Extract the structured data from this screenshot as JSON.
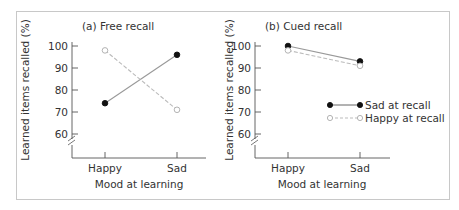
{
  "figure": {
    "border_color": "#c8c8c8",
    "axis_color": "#555555",
    "series_colors": {
      "sad_at_recall": "#999999",
      "happy_at_recall": "#bbbbbb"
    }
  },
  "chart_data": [
    {
      "type": "line",
      "title": "(a) Free recall",
      "xlabel": "Mood at learning",
      "ylabel": "Learned items recalled (%)",
      "categories": [
        "Happy",
        "Sad"
      ],
      "yticks": [
        60,
        70,
        80,
        90,
        100
      ],
      "ylim": [
        55,
        100
      ],
      "axis_break": true,
      "grid": false,
      "series": [
        {
          "name": "Sad at recall",
          "marker": "filled-circle",
          "line": "solid",
          "values": [
            74,
            96
          ]
        },
        {
          "name": "Happy at recall",
          "marker": "open-circle",
          "line": "dashed",
          "values": [
            98,
            71
          ]
        }
      ]
    },
    {
      "type": "line",
      "title": "(b) Cued recall",
      "xlabel": "Mood at learning",
      "ylabel": "Learned items recalled (%)",
      "categories": [
        "Happy",
        "Sad"
      ],
      "yticks": [
        60,
        70,
        80,
        90,
        100
      ],
      "ylim": [
        55,
        100
      ],
      "axis_break": true,
      "grid": false,
      "legend_position": "inside-right",
      "series": [
        {
          "name": "Sad at recall",
          "marker": "filled-circle",
          "line": "solid",
          "values": [
            100,
            93
          ]
        },
        {
          "name": "Happy at recall",
          "marker": "open-circle",
          "line": "dashed",
          "values": [
            98,
            91
          ]
        }
      ]
    }
  ],
  "legend": {
    "items": [
      {
        "label": "Sad at recall"
      },
      {
        "label": "Happy at recall"
      }
    ]
  }
}
